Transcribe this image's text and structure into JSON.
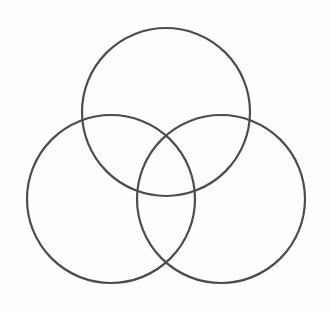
{
  "figure": {
    "type": "venn-diagram",
    "width": 330,
    "height": 312,
    "background_color": "#fefefe",
    "stroke_color": "#4c4c4c",
    "stroke_width": 2.2,
    "labels": {
      "top_circle": "",
      "left_circle": "",
      "right_circle": "",
      "center_region": ""
    }
  },
  "chart_data": {
    "type": "scatter",
    "subtitle": "",
    "xlabel": "",
    "ylabel": "",
    "xlim": [
      0,
      330
    ],
    "ylim": [
      0,
      312
    ],
    "grid": false,
    "legend_position": "none",
    "annotations": [],
    "tick_labels": {
      "x": [],
      "y": []
    },
    "shapes": [
      {
        "name": "top-circle",
        "kind": "circle",
        "cx": 166,
        "cy": 112,
        "r": 84,
        "fill": "none",
        "stroke": "#4c4c4c",
        "stroke_width": 2.2
      },
      {
        "name": "left-circle",
        "kind": "circle",
        "cx": 111,
        "cy": 199,
        "r": 84,
        "fill": "none",
        "stroke": "#4c4c4c",
        "stroke_width": 2.2
      },
      {
        "name": "right-circle",
        "kind": "circle",
        "cx": 221,
        "cy": 199,
        "r": 84,
        "fill": "none",
        "stroke": "#4c4c4c",
        "stroke_width": 2.2
      }
    ],
    "series": [
      {
        "name": "circle centers",
        "x": [
          166,
          111,
          221
        ],
        "y": [
          112,
          199,
          199
        ]
      }
    ]
  }
}
